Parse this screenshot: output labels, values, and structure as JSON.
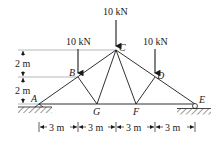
{
  "diagram": {
    "type": "truss",
    "nodes": {
      "A": {
        "label": "A"
      },
      "B": {
        "label": "B"
      },
      "C": {
        "label": "C"
      },
      "D": {
        "label": "D"
      },
      "E": {
        "label": "E"
      },
      "F": {
        "label": "F"
      },
      "G": {
        "label": "G"
      }
    },
    "loads": [
      {
        "node": "C",
        "label": "10 kN"
      },
      {
        "node": "B",
        "label": "10 kN"
      },
      {
        "node": "D",
        "label": "10 kN"
      }
    ],
    "vertical_dims": [
      {
        "label": "2 m"
      },
      {
        "label": "2 m"
      }
    ],
    "horizontal_dims": [
      {
        "label": "3 m"
      },
      {
        "label": "3 m"
      },
      {
        "label": "3 m"
      },
      {
        "label": "3 m"
      }
    ],
    "supports": [
      {
        "node": "A",
        "type": "pin"
      },
      {
        "node": "E",
        "type": "roller"
      }
    ]
  }
}
